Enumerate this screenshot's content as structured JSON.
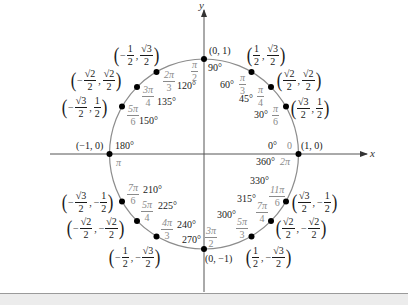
{
  "diagram": {
    "axes": {
      "x_label": "x",
      "y_label": "y"
    },
    "colors": {
      "axis": "#555555",
      "circle": "#8c8c8c",
      "point": "#000000",
      "radian_text": "#8a8a8a",
      "degree_text": "#1a1a1a",
      "footer_band": "#ececec"
    },
    "points": [
      {
        "deg": "0°",
        "deg_alt": "360°",
        "rad": "0",
        "rad_alt_num": "2π",
        "coord": "(1, 0)"
      },
      {
        "deg": "30°",
        "rad_num": "π",
        "rad_den": "6",
        "x_num": "√3",
        "x_den": "2",
        "y_num": "1",
        "y_den": "2",
        "x_sign": "",
        "y_sign": ""
      },
      {
        "deg": "45°",
        "rad_num": "π",
        "rad_den": "4",
        "x_num": "√2",
        "x_den": "2",
        "y_num": "√2",
        "y_den": "2",
        "x_sign": "",
        "y_sign": ""
      },
      {
        "deg": "60°",
        "rad_num": "π",
        "rad_den": "3",
        "x_num": "1",
        "x_den": "2",
        "y_num": "√3",
        "y_den": "2",
        "x_sign": "",
        "y_sign": ""
      },
      {
        "deg": "90°",
        "rad_num": "π",
        "rad_den": "2",
        "coord": "(0, 1)"
      },
      {
        "deg": "120°",
        "rad_num": "2π",
        "rad_den": "3",
        "x_num": "1",
        "x_den": "2",
        "y_num": "√3",
        "y_den": "2",
        "x_sign": "−",
        "y_sign": ""
      },
      {
        "deg": "135°",
        "rad_num": "3π",
        "rad_den": "4",
        "x_num": "√2",
        "x_den": "2",
        "y_num": "√2",
        "y_den": "2",
        "x_sign": "−",
        "y_sign": ""
      },
      {
        "deg": "150°",
        "rad_num": "5π",
        "rad_den": "6",
        "x_num": "√3",
        "x_den": "2",
        "y_num": "1",
        "y_den": "2",
        "x_sign": "−",
        "y_sign": ""
      },
      {
        "deg": "180°",
        "rad": "π",
        "coord": "(−1, 0)"
      },
      {
        "deg": "210°",
        "rad_num": "7π",
        "rad_den": "6",
        "x_num": "√3",
        "x_den": "2",
        "y_num": "1",
        "y_den": "2",
        "x_sign": "−",
        "y_sign": "−"
      },
      {
        "deg": "225°",
        "rad_num": "5π",
        "rad_den": "4",
        "x_num": "√2",
        "x_den": "2",
        "y_num": "√2",
        "y_den": "2",
        "x_sign": "−",
        "y_sign": "−"
      },
      {
        "deg": "240°",
        "rad_num": "4π",
        "rad_den": "3",
        "x_num": "1",
        "x_den": "2",
        "y_num": "√3",
        "y_den": "2",
        "x_sign": "−",
        "y_sign": "−"
      },
      {
        "deg": "270°",
        "rad_num": "3π",
        "rad_den": "2",
        "coord": "(0, −1)"
      },
      {
        "deg": "300°",
        "rad_num": "5π",
        "rad_den": "3",
        "x_num": "1",
        "x_den": "2",
        "y_num": "√3",
        "y_den": "2",
        "x_sign": "",
        "y_sign": "−"
      },
      {
        "deg": "315°",
        "rad_num": "7π",
        "rad_den": "4",
        "x_num": "√2",
        "x_den": "2",
        "y_num": "√2",
        "y_den": "2",
        "x_sign": "",
        "y_sign": "−"
      },
      {
        "deg": "330°",
        "rad_num": "11π",
        "rad_den": "6",
        "x_num": "√3",
        "x_den": "2",
        "y_num": "1",
        "y_den": "2",
        "x_sign": "",
        "y_sign": "−"
      }
    ]
  }
}
